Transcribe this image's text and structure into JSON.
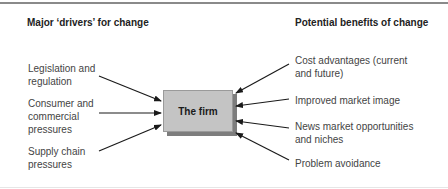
{
  "diagram": {
    "left_heading": "Major ‘drivers’ for change",
    "right_heading": "Potential benefits of change",
    "center_node": "The firm",
    "drivers": [
      {
        "line1": "Legislation and",
        "line2": "regulation",
        "line3": ""
      },
      {
        "line1": "Consumer and",
        "line2": "commercial",
        "line3": "pressures"
      },
      {
        "line1": "Supply chain",
        "line2": "pressures",
        "line3": ""
      }
    ],
    "benefits": [
      {
        "line1": "Cost advantages (current",
        "line2": "and future)"
      },
      {
        "line1": "Improved market image",
        "line2": ""
      },
      {
        "line1": "News market opportunities",
        "line2": "and niches"
      },
      {
        "line1": "Problem avoidance",
        "line2": ""
      }
    ],
    "colors": {
      "box_fill": "#c4c4c4",
      "box_shadow": "#7d7d7d",
      "arrow": "#1a1a1a",
      "rule": "#8a8a8a"
    }
  }
}
